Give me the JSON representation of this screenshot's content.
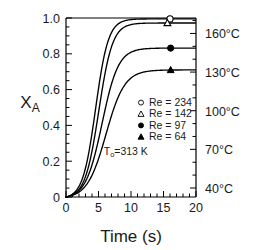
{
  "chart_data": {
    "type": "line",
    "title": "",
    "xlabel": "Time (s)",
    "ylabel": "X_A",
    "ylabel_base": "X",
    "ylabel_sub": "A",
    "xlim": [
      0,
      20
    ],
    "ylim": [
      0,
      1.0
    ],
    "grid": false,
    "legend_position": "center",
    "x_ticks": [
      0,
      5,
      10,
      15,
      20
    ],
    "x_tick_labels": [
      "0",
      "5",
      "10",
      "15",
      "20"
    ],
    "x_minor_step": 1,
    "y_ticks": [
      0,
      0.2,
      0.4,
      0.6,
      0.8,
      1.0
    ],
    "y_tick_labels": [
      "0",
      "0.2",
      "0.4",
      "0.6",
      "0.8",
      "1.0"
    ],
    "y_minor_step": 0.05,
    "right_axis": {
      "label": "Temperature",
      "unit": "°C",
      "ticks": [
        40,
        70,
        100,
        130,
        160
      ],
      "tick_labels": [
        "40°C",
        "70°C",
        "100°C",
        "130°C",
        "160°C"
      ],
      "lim": [
        33,
        172
      ],
      "minor_step": 10
    },
    "annotations": [
      {
        "name": "inlet-temperature",
        "base": "T",
        "sub": "o",
        "rest": "=313 K",
        "x": 9.2,
        "y": 0.235
      }
    ],
    "series": [
      {
        "name": "Re = 234",
        "re": 234,
        "marker": "open-circle",
        "marker_x": 16.0,
        "plateau": 0.995,
        "midpoint": 4.55,
        "steepness": 1.02,
        "color": "#000000"
      },
      {
        "name": "Re = 142",
        "re": 142,
        "marker": "open-triangle",
        "marker_x": 15.6,
        "plateau": 0.972,
        "midpoint": 5.05,
        "steepness": 0.95,
        "color": "#000000"
      },
      {
        "name": "Re = 97",
        "re": 97,
        "marker": "filled-circle",
        "marker_x": 16.1,
        "plateau": 0.832,
        "midpoint": 5.55,
        "steepness": 0.8,
        "color": "#000000"
      },
      {
        "name": "Re = 64",
        "re": 64,
        "marker": "filled-triangle",
        "marker_x": 16.1,
        "plateau": 0.71,
        "midpoint": 6.15,
        "steepness": 0.7,
        "color": "#000000"
      }
    ],
    "legend_entries": [
      {
        "marker": "open-circle",
        "label": "Re = 234"
      },
      {
        "marker": "open-triangle",
        "label": "Re = 142"
      },
      {
        "marker": "filled-circle",
        "label": "Re = 97"
      },
      {
        "marker": "filled-triangle",
        "label": "Re = 64"
      }
    ]
  }
}
